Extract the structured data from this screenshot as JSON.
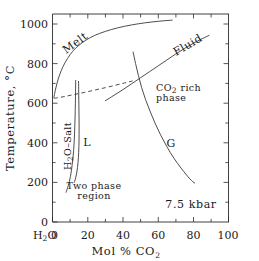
{
  "figure": {
    "background": "#ffffff",
    "ink_color": "#2b2b2b"
  },
  "chart_data": {
    "type": "line",
    "title": "",
    "subtitle": "",
    "xlabel": "Mol % CO2",
    "xlabel_parts": {
      "pre": "Mol ",
      "percent": "%",
      "mid": " CO",
      "sub": "2"
    },
    "ylabel": "Temperature, °C",
    "xlim": [
      0,
      100
    ],
    "ylim": [
      0,
      1050
    ],
    "grid": false,
    "legend": "none",
    "xticks": [
      0,
      20,
      40,
      60,
      80,
      100
    ],
    "xticklabels": [
      "0",
      "20",
      "40",
      "60",
      "80",
      "100"
    ],
    "xtick_minor": [
      10,
      30,
      50,
      70,
      90
    ],
    "yticks": [
      0,
      200,
      400,
      600,
      800,
      1000
    ],
    "yticklabels": [
      "0",
      "200",
      "400",
      "600",
      "800",
      "1000"
    ],
    "ytick_minor": [
      100,
      300,
      500,
      700,
      900
    ],
    "origin_label": "H2O",
    "origin_label_parts": {
      "pre": "H",
      "sub": "2",
      "post": "O"
    },
    "annotation": "7.5 kbar",
    "series": [
      {
        "name": "Melt boundary (solidus / liquidus upper curve)",
        "style": "solid",
        "points": [
          [
            0.8,
            628
          ],
          [
            1.6,
            665
          ],
          [
            2.6,
            702
          ],
          [
            4.0,
            742
          ],
          [
            6.0,
            785
          ],
          [
            8.5,
            825
          ],
          [
            11.5,
            862
          ],
          [
            15.0,
            892
          ],
          [
            19.0,
            918
          ],
          [
            24.0,
            942
          ],
          [
            30.0,
            962
          ],
          [
            37.0,
            980
          ],
          [
            45.0,
            995
          ],
          [
            53.0,
            1006
          ],
          [
            61.0,
            1014
          ],
          [
            68.0,
            1019
          ]
        ]
      },
      {
        "name": "Fluid boundary (CO2 rich phase upper limb)",
        "style": "solid",
        "points": [
          [
            30.0,
            612
          ],
          [
            35.0,
            640
          ],
          [
            40.0,
            668
          ],
          [
            45.0,
            698
          ],
          [
            50.0,
            728
          ],
          [
            55.0,
            758
          ],
          [
            60.0,
            788
          ],
          [
            65.0,
            818
          ],
          [
            70.0,
            848
          ],
          [
            75.0,
            876
          ],
          [
            80.0,
            902
          ],
          [
            85.0,
            925
          ],
          [
            89.0,
            942
          ]
        ]
      },
      {
        "name": "H2O-Salt phase boundary (near-vertical left curve)",
        "style": "solid",
        "points": [
          [
            13.2,
            715
          ],
          [
            13.1,
            660
          ],
          [
            13.0,
            600
          ],
          [
            12.8,
            520
          ],
          [
            12.5,
            440
          ],
          [
            12.0,
            360
          ],
          [
            11.2,
            290
          ],
          [
            10.2,
            230
          ],
          [
            9.0,
            185
          ],
          [
            7.7,
            150
          ]
        ]
      },
      {
        "name": "L phase boundary (inner near-vertical curve)",
        "style": "solid",
        "points": [
          [
            14.8,
            710
          ],
          [
            14.9,
            650
          ],
          [
            15.0,
            580
          ],
          [
            15.1,
            510
          ],
          [
            15.1,
            440
          ],
          [
            15.0,
            380
          ],
          [
            14.7,
            325
          ],
          [
            14.2,
            275
          ],
          [
            13.4,
            232
          ],
          [
            12.4,
            200
          ]
        ]
      },
      {
        "name": "G phase boundary (descending right curve)",
        "style": "solid",
        "points": [
          [
            45.8,
            858
          ],
          [
            47.2,
            800
          ],
          [
            48.8,
            740
          ],
          [
            50.6,
            680
          ],
          [
            52.8,
            620
          ],
          [
            55.4,
            560
          ],
          [
            58.2,
            500
          ],
          [
            61.4,
            440
          ],
          [
            65.0,
            380
          ],
          [
            69.0,
            322
          ],
          [
            73.4,
            268
          ],
          [
            78.0,
            218
          ],
          [
            80.8,
            196
          ]
        ]
      },
      {
        "name": "Two phase region boundary (dashed solvus)",
        "style": "dashed",
        "points": [
          [
            0.8,
            624
          ],
          [
            6.0,
            632
          ],
          [
            12.0,
            643
          ],
          [
            18.0,
            654
          ],
          [
            24.0,
            666
          ],
          [
            30.0,
            678
          ],
          [
            36.0,
            691
          ],
          [
            41.0,
            702
          ],
          [
            45.5,
            712
          ]
        ]
      }
    ],
    "region_labels": [
      {
        "id": "melt",
        "text": "Melt",
        "x": 12,
        "y": 905,
        "rotation": -36
      },
      {
        "id": "fluid",
        "text": "Fluid",
        "x": 72,
        "y": 920,
        "rotation": -30
      },
      {
        "id": "h2o-salt",
        "text": "H2O-Salt",
        "x": 12.3,
        "y": 430,
        "rotation": -90
      },
      {
        "id": "l",
        "text": "L",
        "x": 19.5,
        "y": 408,
        "rotation": 0
      },
      {
        "id": "g",
        "text": "G",
        "x": 67.5,
        "y": 405,
        "rotation": 0
      },
      {
        "id": "co2-rich-phase",
        "text": "CO2 rich phase",
        "x": 62,
        "y": 640,
        "rotation": 0
      },
      {
        "id": "two-phase-region",
        "text": "Two phase region",
        "x": 24,
        "y": 190,
        "rotation": 0
      }
    ],
    "region_label_text": {
      "melt": "Melt",
      "fluid": "Fluid",
      "h2o_salt_pre": "H",
      "h2o_salt_sub": "2",
      "h2o_salt_post": "O–Salt",
      "l": "L",
      "g": "G",
      "co2_rich_pre": "CO",
      "co2_rich_sub": "2",
      "co2_rich_post": " rich",
      "co2_rich_line2": "phase",
      "two_phase_line1": "Two phase",
      "two_phase_line2": "region"
    }
  }
}
